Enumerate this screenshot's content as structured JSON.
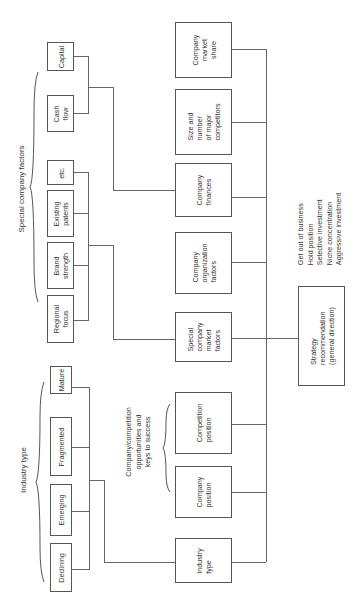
{
  "diagram": {
    "orientation": "rotated 90 degrees counterclockwise",
    "groups": {
      "special_company_factors": {
        "label": "Special company factors",
        "items": [
          "Capital",
          "Cash\nflow",
          "etc.",
          "Existing\npatents",
          "Brand\nstrength",
          "Regional\nfocus"
        ]
      },
      "industry_type": {
        "label": "Industry type",
        "items": [
          "Mature",
          "Fragmented",
          "Emerging",
          "Declining"
        ]
      },
      "company_competition": {
        "label": "Company/competition\nopportunities and\nkeys to success"
      }
    },
    "middle_column": [
      "Company\nmarket\nshare",
      "Size and\nnumber\nof major\ncompetitors",
      "Company\nfinances",
      "Company\norganization\nfactors",
      "Special\ncompany\nmarket\nfactors",
      "Competition\nposition",
      "Company\nposition",
      "Industry\ntype"
    ],
    "result": {
      "label": "Strategy\nrecommendation\n(general direction)",
      "options": "Get out of business\nHold position\nSelective investment\nNiche concentration\nAggressive investment"
    }
  }
}
